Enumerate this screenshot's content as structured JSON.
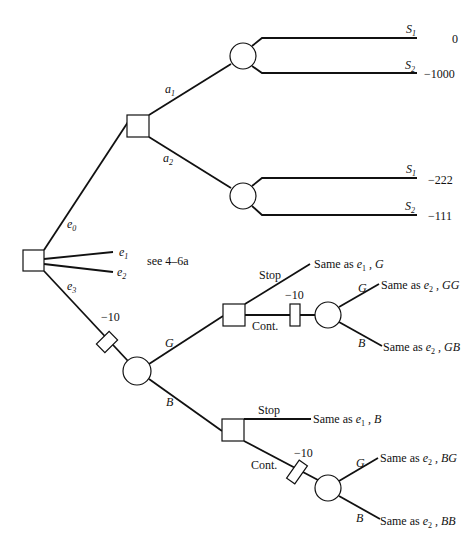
{
  "diagram": {
    "type": "decision-tree",
    "root": {
      "label": ""
    },
    "experiments": [
      {
        "label": "e",
        "sub": "0"
      },
      {
        "label": "e",
        "sub": "1"
      },
      {
        "label": "e",
        "sub": "2"
      },
      {
        "label": "e",
        "sub": "3"
      }
    ],
    "see_note": "see 4–6a",
    "actions": [
      {
        "label": "a",
        "sub": "1"
      },
      {
        "label": "a",
        "sub": "2"
      }
    ],
    "states": [
      {
        "label": "S",
        "sub": "1",
        "value": "0"
      },
      {
        "label": "S",
        "sub": "2",
        "value": "−1000"
      },
      {
        "label": "S",
        "sub": "1",
        "value": "−222"
      },
      {
        "label": "S",
        "sub": "2",
        "value": "−111"
      }
    ],
    "costs": {
      "e3": "−10",
      "cont_g": "−10",
      "cont_b": "−10"
    },
    "outcomes": {
      "g": "G",
      "b": "B"
    },
    "choices": {
      "stop": "Stop",
      "cont": "Cont."
    },
    "results": {
      "g_stop": {
        "prefix": "Same as ",
        "e": "e",
        "sub": "1",
        "suffix": " , G"
      },
      "gg": {
        "prefix": "Same as ",
        "e": "e",
        "sub": "2",
        "suffix": " , GG"
      },
      "gb": {
        "prefix": "Same as ",
        "e": "e",
        "sub": "2",
        "suffix": " , GB"
      },
      "b_stop": {
        "prefix": "Same as ",
        "e": "e",
        "sub": "1",
        "suffix": " , B"
      },
      "bg": {
        "prefix": "Same as ",
        "e": "e",
        "sub": "2",
        "suffix": " , BG"
      },
      "bb": {
        "prefix": "Same as ",
        "e": "e",
        "sub": "2",
        "suffix": " , BB"
      }
    }
  }
}
